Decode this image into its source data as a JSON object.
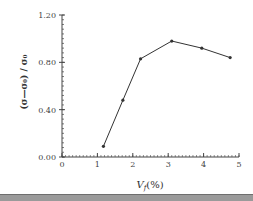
{
  "chart_data": {
    "type": "line",
    "title": "",
    "xlabel": "V_f(%)",
    "ylabel": "(σ−σ₀) / σ₀",
    "x": [
      1.17,
      1.72,
      2.22,
      3.1,
      3.95,
      4.75
    ],
    "series": [
      {
        "name": "(σ−σ₀)/σ₀",
        "values": [
          0.09,
          0.48,
          0.83,
          0.98,
          0.92,
          0.84
        ]
      }
    ],
    "xlim": [
      0,
      5
    ],
    "ylim": [
      0,
      1.2
    ],
    "xticks": [
      "0",
      "1",
      "2",
      "3",
      "4",
      "5"
    ],
    "yticks": [
      "0.00",
      "0.40",
      "0.80",
      "1.20"
    ],
    "grid": false,
    "legend": "none",
    "line_color": "#333333"
  },
  "labels": {
    "x_axis_main": "V",
    "x_axis_sub": "f",
    "x_axis_unit": "(%)",
    "y_axis": "(σ—σ₀) / σ₀"
  }
}
